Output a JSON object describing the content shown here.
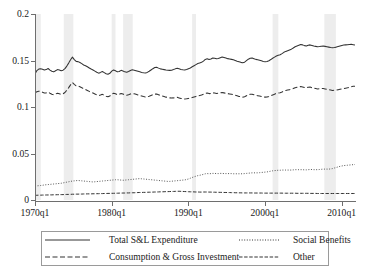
{
  "chart_data": {
    "type": "line",
    "title": "",
    "subtitle": "",
    "xlabel": "",
    "ylabel": "",
    "xlim": [
      "1970q1",
      "2011q4"
    ],
    "ylim": [
      0,
      0.2
    ],
    "grid": false,
    "legend_position": "bottom-outside",
    "y_ticks": [
      "0",
      "0.05",
      "0.1",
      "0.15",
      "0.2"
    ],
    "y_tick_values": [
      0,
      0.05,
      0.1,
      0.15,
      0.2
    ],
    "x_ticks": [
      "1970q1",
      "1980q1",
      "1990q1",
      "2000q1",
      "2010q1"
    ],
    "x_tick_values": [
      1970.0,
      1980.0,
      1990.0,
      2000.0,
      2010.0
    ],
    "x_quarters_start": 1970.0,
    "x_quarters_end": 2011.75,
    "recession_bands": [
      {
        "start": 1969.75,
        "end": 1970.75
      },
      {
        "start": 1973.75,
        "end": 1975.0
      },
      {
        "start": 1980.0,
        "end": 1980.5
      },
      {
        "start": 1981.5,
        "end": 1982.75
      },
      {
        "start": 1990.5,
        "end": 1991.0
      },
      {
        "start": 2001.0,
        "end": 2001.75
      },
      {
        "start": 2007.75,
        "end": 2009.25
      }
    ],
    "recession_band_color": "#ededed",
    "series": [
      {
        "name": "Total S&L Expenditure",
        "style": "solid",
        "color": "#333333",
        "values": [
          0.1355,
          0.1392,
          0.1408,
          0.1412,
          0.1406,
          0.1398,
          0.1402,
          0.1414,
          0.1396,
          0.1384,
          0.1378,
          0.139,
          0.1402,
          0.1398,
          0.1389,
          0.1396,
          0.1412,
          0.144,
          0.1472,
          0.1508,
          0.1536,
          0.151,
          0.149,
          0.1488,
          0.1478,
          0.1466,
          0.1452,
          0.1444,
          0.1432,
          0.142,
          0.1408,
          0.1398,
          0.1386,
          0.1374,
          0.1364,
          0.1372,
          0.1382,
          0.137,
          0.1358,
          0.1352,
          0.1362,
          0.1386,
          0.1398,
          0.139,
          0.1378,
          0.1382,
          0.1394,
          0.1388,
          0.1378,
          0.1374,
          0.1382,
          0.1392,
          0.14,
          0.1396,
          0.139,
          0.1384,
          0.1378,
          0.1372,
          0.1368,
          0.1366,
          0.1372,
          0.1384,
          0.1398,
          0.1412,
          0.1424,
          0.1428,
          0.1418,
          0.141,
          0.1406,
          0.1402,
          0.1398,
          0.1396,
          0.1394,
          0.1396,
          0.1402,
          0.141,
          0.1416,
          0.141,
          0.1404,
          0.14,
          0.1398,
          0.1404,
          0.1412,
          0.142,
          0.1432,
          0.1444,
          0.1456,
          0.1468,
          0.1474,
          0.148,
          0.1494,
          0.1512,
          0.1518,
          0.151,
          0.1516,
          0.1526,
          0.1524,
          0.1518,
          0.1522,
          0.153,
          0.1538,
          0.1532,
          0.1526,
          0.152,
          0.1516,
          0.1512,
          0.1508,
          0.15,
          0.1492,
          0.1486,
          0.148,
          0.1476,
          0.1482,
          0.1498,
          0.1514,
          0.1524,
          0.1528,
          0.152,
          0.1512,
          0.1508,
          0.1502,
          0.1496,
          0.149,
          0.1486,
          0.149,
          0.1498,
          0.151,
          0.1524,
          0.1536,
          0.1548,
          0.1556,
          0.1562,
          0.1574,
          0.1588,
          0.1598,
          0.1606,
          0.1614,
          0.1622,
          0.1634,
          0.1648,
          0.1656,
          0.1664,
          0.1672,
          0.1668,
          0.166,
          0.1656,
          0.1664,
          0.1668,
          0.1662,
          0.1656,
          0.1652,
          0.1648,
          0.165,
          0.1654,
          0.1656,
          0.1652,
          0.1648,
          0.1644,
          0.164,
          0.1638,
          0.164,
          0.1644,
          0.165,
          0.1656,
          0.1662,
          0.1666,
          0.1668,
          0.167,
          0.1672,
          0.1674,
          0.167,
          0.1666
        ]
      },
      {
        "name": "Consumption & Gross Investment",
        "style": "dashed",
        "color": "#333333",
        "values": [
          0.1152,
          0.1164,
          0.117,
          0.1166,
          0.1158,
          0.115,
          0.1152,
          0.116,
          0.1148,
          0.1138,
          0.1132,
          0.114,
          0.1148,
          0.1142,
          0.1136,
          0.1142,
          0.1156,
          0.118,
          0.1208,
          0.1238,
          0.1264,
          0.1244,
          0.1228,
          0.1226,
          0.1218,
          0.1208,
          0.1196,
          0.1188,
          0.1178,
          0.1168,
          0.1158,
          0.115,
          0.114,
          0.113,
          0.1122,
          0.1128,
          0.1136,
          0.1126,
          0.1116,
          0.111,
          0.1118,
          0.1138,
          0.1148,
          0.1142,
          0.1132,
          0.1136,
          0.1146,
          0.114,
          0.113,
          0.1126,
          0.1132,
          0.114,
          0.1146,
          0.1142,
          0.1136,
          0.113,
          0.1124,
          0.1118,
          0.1112,
          0.1108,
          0.111,
          0.1116,
          0.1124,
          0.1132,
          0.1138,
          0.114,
          0.1132,
          0.1124,
          0.1118,
          0.1112,
          0.1106,
          0.1102,
          0.1098,
          0.1096,
          0.1098,
          0.1102,
          0.1104,
          0.1098,
          0.1092,
          0.1088,
          0.1086,
          0.1088,
          0.1092,
          0.1096,
          0.1102,
          0.1108,
          0.1114,
          0.112,
          0.1124,
          0.1128,
          0.1136,
          0.1146,
          0.115,
          0.1144,
          0.1146,
          0.1152,
          0.115,
          0.1146,
          0.1148,
          0.1152,
          0.1156,
          0.1152,
          0.1148,
          0.1144,
          0.114,
          0.1136,
          0.1132,
          0.1126,
          0.112,
          0.1114,
          0.111,
          0.1106,
          0.111,
          0.112,
          0.113,
          0.1136,
          0.1138,
          0.1132,
          0.1126,
          0.1122,
          0.1118,
          0.1114,
          0.111,
          0.1106,
          0.1108,
          0.1114,
          0.1122,
          0.113,
          0.1138,
          0.1146,
          0.115,
          0.1154,
          0.1162,
          0.1172,
          0.1178,
          0.1182,
          0.1186,
          0.119,
          0.1198,
          0.1208,
          0.1212,
          0.1216,
          0.122,
          0.1216,
          0.121,
          0.1206,
          0.1212,
          0.1214,
          0.1208,
          0.1202,
          0.1198,
          0.1194,
          0.1196,
          0.1198,
          0.1198,
          0.1194,
          0.119,
          0.1186,
          0.1182,
          0.1178,
          0.118,
          0.1182,
          0.1186,
          0.119,
          0.1194,
          0.1198,
          0.1202,
          0.1206,
          0.1212,
          0.1218,
          0.1222,
          0.1224
        ]
      },
      {
        "name": "Social Benefits",
        "style": "dotted",
        "color": "#555555",
        "values": [
          0.0148,
          0.0152,
          0.0154,
          0.0156,
          0.0158,
          0.0162,
          0.0164,
          0.0166,
          0.0168,
          0.017,
          0.0172,
          0.0174,
          0.0176,
          0.0178,
          0.018,
          0.0184,
          0.0188,
          0.0192,
          0.0196,
          0.02,
          0.0204,
          0.0206,
          0.0208,
          0.021,
          0.0208,
          0.0206,
          0.0204,
          0.0202,
          0.02,
          0.0198,
          0.0196,
          0.0194,
          0.0196,
          0.0198,
          0.02,
          0.0202,
          0.0204,
          0.0206,
          0.0208,
          0.021,
          0.0212,
          0.0214,
          0.0216,
          0.0218,
          0.0218,
          0.0216,
          0.0214,
          0.0212,
          0.0214,
          0.0216,
          0.0218,
          0.022,
          0.0222,
          0.0224,
          0.0226,
          0.0228,
          0.023,
          0.0228,
          0.0226,
          0.0224,
          0.0222,
          0.022,
          0.0218,
          0.0216,
          0.0214,
          0.0212,
          0.021,
          0.0208,
          0.0206,
          0.0204,
          0.0202,
          0.02,
          0.02,
          0.0202,
          0.0204,
          0.0206,
          0.0208,
          0.021,
          0.0212,
          0.0214,
          0.0216,
          0.022,
          0.0226,
          0.0234,
          0.0242,
          0.025,
          0.0256,
          0.0262,
          0.0266,
          0.027,
          0.0276,
          0.0282,
          0.0284,
          0.0282,
          0.0284,
          0.0286,
          0.0286,
          0.0284,
          0.0284,
          0.0286,
          0.0286,
          0.0284,
          0.0284,
          0.0284,
          0.0284,
          0.0284,
          0.0282,
          0.0282,
          0.0282,
          0.0282,
          0.0282,
          0.0282,
          0.0284,
          0.0286,
          0.0288,
          0.029,
          0.0292,
          0.0292,
          0.0292,
          0.0292,
          0.0294,
          0.0296,
          0.0298,
          0.03,
          0.0302,
          0.0306,
          0.031,
          0.0314,
          0.0316,
          0.0318,
          0.032,
          0.032,
          0.0322,
          0.0322,
          0.0322,
          0.0322,
          0.0322,
          0.0322,
          0.0324,
          0.0326,
          0.0326,
          0.0326,
          0.0326,
          0.0326,
          0.0324,
          0.0324,
          0.0326,
          0.0328,
          0.0328,
          0.0326,
          0.0326,
          0.0326,
          0.0328,
          0.033,
          0.0332,
          0.0332,
          0.0332,
          0.0332,
          0.0334,
          0.0338,
          0.0344,
          0.035,
          0.0356,
          0.0362,
          0.0366,
          0.037,
          0.0372,
          0.0374,
          0.0376,
          0.0378,
          0.038,
          0.0382
        ]
      },
      {
        "name": "Other",
        "style": "dashdot",
        "color": "#333333",
        "values": [
          0.005,
          0.0051,
          0.0052,
          0.0052,
          0.0053,
          0.0053,
          0.0054,
          0.0054,
          0.0055,
          0.0055,
          0.0056,
          0.0056,
          0.0057,
          0.0057,
          0.0058,
          0.0058,
          0.0059,
          0.006,
          0.006,
          0.0061,
          0.0062,
          0.0062,
          0.0063,
          0.0063,
          0.0064,
          0.0064,
          0.0065,
          0.0065,
          0.0066,
          0.0066,
          0.0066,
          0.0067,
          0.0067,
          0.0068,
          0.0068,
          0.0069,
          0.0069,
          0.007,
          0.007,
          0.0071,
          0.0071,
          0.0072,
          0.0072,
          0.0073,
          0.0073,
          0.0074,
          0.0074,
          0.0075,
          0.0075,
          0.0076,
          0.0076,
          0.0077,
          0.0078,
          0.0078,
          0.0079,
          0.008,
          0.0081,
          0.0081,
          0.0082,
          0.0082,
          0.0083,
          0.0084,
          0.0084,
          0.0085,
          0.0086,
          0.0086,
          0.0087,
          0.0088,
          0.0088,
          0.0089,
          0.009,
          0.009,
          0.0091,
          0.0092,
          0.0092,
          0.0093,
          0.0094,
          0.0094,
          0.0093,
          0.0092,
          0.0091,
          0.009,
          0.0089,
          0.0088,
          0.0088,
          0.0087,
          0.0086,
          0.0086,
          0.0085,
          0.0085,
          0.0086,
          0.0086,
          0.0086,
          0.0085,
          0.0085,
          0.0084,
          0.0084,
          0.0083,
          0.0083,
          0.0082,
          0.0082,
          0.0081,
          0.0081,
          0.008,
          0.008,
          0.0079,
          0.0079,
          0.0078,
          0.0078,
          0.0077,
          0.0077,
          0.0076,
          0.0076,
          0.0076,
          0.0076,
          0.0076,
          0.0076,
          0.0075,
          0.0075,
          0.0075,
          0.0075,
          0.0075,
          0.0074,
          0.0074,
          0.0074,
          0.0074,
          0.0074,
          0.0074,
          0.0074,
          0.0074,
          0.0074,
          0.0074,
          0.0074,
          0.0073,
          0.0073,
          0.0073,
          0.0073,
          0.0073,
          0.0073,
          0.0073,
          0.0072,
          0.0072,
          0.0072,
          0.0072,
          0.0072,
          0.0072,
          0.0072,
          0.0071,
          0.0071,
          0.0071,
          0.0071,
          0.007,
          0.007,
          0.007,
          0.007,
          0.007,
          0.007,
          0.007,
          0.007,
          0.007,
          0.007,
          0.007,
          0.007,
          0.007,
          0.007,
          0.007,
          0.007,
          0.007,
          0.007,
          0.007,
          0.007,
          0.007
        ]
      }
    ]
  },
  "legend": {
    "entries": [
      {
        "label": "Total S&L Expenditure",
        "style": "solid"
      },
      {
        "label": "Social Benefits",
        "style": "dotted"
      },
      {
        "label": "Consumption & Gross Investment",
        "style": "dashed"
      },
      {
        "label": "Other",
        "style": "dashdot"
      }
    ]
  }
}
